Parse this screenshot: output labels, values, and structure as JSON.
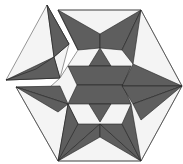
{
  "figure": {
    "colors": {
      "dark": "#5e5e5e",
      "light": "#f4f4f4",
      "stroke": "#222222",
      "background": "#ffffff"
    },
    "shape": "hexagon",
    "pieces": {
      "main": "hexagon with six-pointed star pattern of dark rhombi and triangles",
      "detached": "top-left wedge piece separated from hexagon"
    }
  }
}
